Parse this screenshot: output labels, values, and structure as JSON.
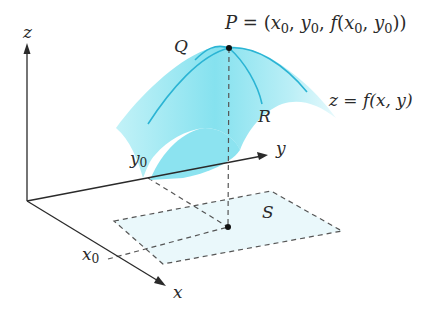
{
  "diagram": {
    "type": "3d-surface-over-region",
    "colors": {
      "surface_fill": "#7fe0ee",
      "surface_curves": "#2bb4d4",
      "region_fill": "#eaf8fb",
      "axes": "#2a2a2a",
      "dashed": "#555555",
      "point": "#111111"
    },
    "axes": {
      "x_label": "x",
      "y_label": "y",
      "z_label": "z"
    },
    "ticks": {
      "x0": {
        "base": "x",
        "sub": "0"
      },
      "y0": {
        "base": "y",
        "sub": "0"
      }
    },
    "points": {
      "P_label": "P",
      "P_eq": "= (",
      "P_x": "x",
      "P_y": "y",
      "P_f": "f",
      "P_sub": "0",
      "Q_label": "Q",
      "R_label": "R"
    },
    "surface_label": "z = f(x, y)",
    "region_label": "S"
  }
}
